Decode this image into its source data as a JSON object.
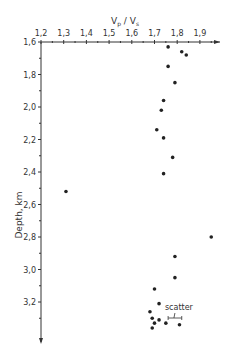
{
  "chart_data": {
    "type": "scatter",
    "title": "",
    "xlabel": "Vp / Vs",
    "xlabel_parts": {
      "main": "V",
      "sub1": "p",
      "sep": " / V",
      "sub2": "s"
    },
    "ylabel": "Depth, km",
    "xlim": [
      1.2,
      1.98
    ],
    "ylim": [
      1.6,
      3.35
    ],
    "y_inverted": true,
    "x_axis_position": "top",
    "grid": false,
    "x_ticks": [
      "1,2",
      "1,3",
      "1,4",
      "1,5",
      "1,6",
      "1,7",
      "1,8",
      "1,9"
    ],
    "x_tick_values": [
      1.2,
      1.3,
      1.4,
      1.5,
      1.6,
      1.7,
      1.8,
      1.9
    ],
    "y_ticks": [
      "1,6",
      "1,8",
      "2,0",
      "2,2",
      "2,4",
      "2,6",
      "2,8",
      "3,0",
      "3,2"
    ],
    "y_tick_values": [
      1.6,
      1.8,
      2.0,
      2.2,
      2.4,
      2.6,
      2.8,
      3.0,
      3.2
    ],
    "points": [
      {
        "x": 1.76,
        "y": 1.63
      },
      {
        "x": 1.82,
        "y": 1.66
      },
      {
        "x": 1.84,
        "y": 1.68
      },
      {
        "x": 1.76,
        "y": 1.75
      },
      {
        "x": 1.79,
        "y": 1.85
      },
      {
        "x": 1.74,
        "y": 1.96
      },
      {
        "x": 1.73,
        "y": 2.02
      },
      {
        "x": 1.71,
        "y": 2.14
      },
      {
        "x": 1.74,
        "y": 2.19
      },
      {
        "x": 1.78,
        "y": 2.31
      },
      {
        "x": 1.74,
        "y": 2.41
      },
      {
        "x": 1.31,
        "y": 2.52
      },
      {
        "x": 1.95,
        "y": 2.8
      },
      {
        "x": 1.79,
        "y": 2.92
      },
      {
        "x": 1.79,
        "y": 3.05
      },
      {
        "x": 1.7,
        "y": 3.12
      },
      {
        "x": 1.72,
        "y": 3.21
      },
      {
        "x": 1.68,
        "y": 3.26
      },
      {
        "x": 1.69,
        "y": 3.3
      },
      {
        "x": 1.72,
        "y": 3.31
      },
      {
        "x": 1.7,
        "y": 3.33
      },
      {
        "x": 1.69,
        "y": 3.36
      },
      {
        "x": 1.75,
        "y": 3.33
      },
      {
        "x": 1.81,
        "y": 3.34
      }
    ],
    "annotations": [
      {
        "text": "scatter",
        "type": "error-bar-legend",
        "x_from": 1.76,
        "x_to": 1.82,
        "y": 3.32
      }
    ]
  }
}
